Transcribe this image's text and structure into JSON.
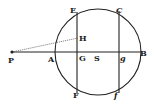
{
  "diagram": {
    "type": "geometric-figure",
    "circle": {
      "cx": 98,
      "cy": 52,
      "r": 43
    },
    "points": {
      "P": {
        "label": "P",
        "x": 12,
        "y": 52
      },
      "A": {
        "label": "A",
        "x": 55,
        "y": 52
      },
      "G": {
        "label": "G",
        "x": 77,
        "y": 52
      },
      "S": {
        "label": "S",
        "x": 97,
        "y": 52
      },
      "g": {
        "label": "g",
        "x": 119,
        "y": 52
      },
      "B": {
        "label": "B",
        "x": 141,
        "y": 52
      },
      "E": {
        "label": "E",
        "x": 77,
        "y": 11
      },
      "F": {
        "label": "F",
        "x": 77,
        "y": 93
      },
      "C": {
        "label": "C",
        "x": 119,
        "y": 11
      },
      "f": {
        "label": "f",
        "x": 119,
        "y": 93
      },
      "H": {
        "label": "H",
        "x": 78,
        "y": 38
      }
    },
    "segments": [
      {
        "from": "P",
        "to": "B",
        "style": "solid"
      },
      {
        "from": "E",
        "to": "F",
        "style": "solid"
      },
      {
        "from": "C",
        "to": "f",
        "style": "solid"
      },
      {
        "from": "P",
        "to": "H",
        "style": "thin"
      }
    ],
    "colors": {
      "ink": "#222222",
      "paper": "#ffffff"
    }
  }
}
